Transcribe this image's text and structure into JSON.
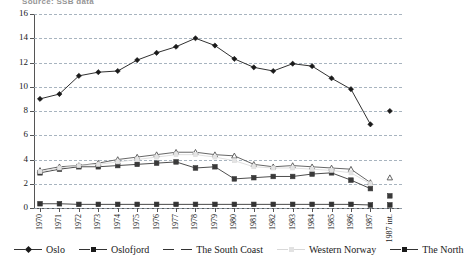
{
  "source_note": "Source: SSB data",
  "chart_data": {
    "type": "line",
    "title": "",
    "xlabel": "",
    "ylabel": "",
    "ylim": [
      0,
      16
    ],
    "yticks": [
      0,
      2,
      4,
      6,
      8,
      10,
      12,
      14,
      16
    ],
    "grid": true,
    "legend_position": "bottom",
    "categories": [
      "1970",
      "1971",
      "1972",
      "1973",
      "1974",
      "1975",
      "1976",
      "1977",
      "1978",
      "1979",
      "1980",
      "1981",
      "1982",
      "1983",
      "1984",
      "1985",
      "1986",
      "1987",
      "1987 int."
    ],
    "series": [
      {
        "name": "Oslo",
        "marker": "filled-diamond",
        "color": "#1a1a1a",
        "values": [
          9.0,
          9.4,
          10.9,
          11.2,
          11.3,
          12.2,
          12.8,
          13.3,
          14.0,
          13.4,
          12.3,
          11.6,
          11.3,
          11.9,
          11.7,
          10.7,
          9.8,
          6.9,
          5.2
        ]
      },
      {
        "name": "Oslofjord",
        "marker": "filled-square",
        "color": "#3a3a3a",
        "values": [
          2.9,
          3.2,
          3.4,
          3.4,
          3.5,
          3.6,
          3.7,
          3.8,
          3.3,
          3.4,
          2.4,
          2.5,
          2.6,
          2.6,
          2.8,
          2.9,
          2.3,
          1.6,
          1.0
        ]
      },
      {
        "name": "The South Coast",
        "marker": "open-triangle",
        "color": "#555555",
        "values": [
          3.1,
          3.4,
          3.5,
          3.7,
          4.0,
          4.2,
          4.4,
          4.6,
          4.6,
          4.4,
          4.3,
          3.6,
          3.4,
          3.5,
          3.4,
          3.3,
          3.2,
          2.1,
          1.2
        ]
      },
      {
        "name": "Western Norway",
        "marker": "faint",
        "color": "#d8d8d8",
        "values": [
          3.0,
          3.3,
          3.5,
          3.6,
          3.8,
          4.0,
          4.2,
          4.4,
          4.4,
          4.2,
          3.9,
          3.4,
          3.3,
          3.3,
          3.2,
          3.1,
          2.9,
          2.0,
          1.1
        ]
      },
      {
        "name": "The North",
        "marker": "filled-square",
        "color": "#333333",
        "values": [
          0.35,
          0.35,
          0.3,
          0.3,
          0.3,
          0.3,
          0.3,
          0.3,
          0.3,
          0.3,
          0.3,
          0.3,
          0.3,
          0.3,
          0.3,
          0.3,
          0.3,
          0.25,
          0.25
        ]
      }
    ],
    "detached_last_column": {
      "label": "1987 int.",
      "points": [
        {
          "series": "Oslo",
          "value": 8.0,
          "marker": "filled-diamond"
        },
        {
          "series": "The South Coast",
          "value": 2.5,
          "marker": "open-triangle"
        },
        {
          "series": "Oslofjord",
          "value": 1.0,
          "marker": "filled-square"
        },
        {
          "series": "The North",
          "value": 0.25,
          "marker": "filled-square"
        }
      ]
    }
  },
  "legend": {
    "items": [
      {
        "label": "Oslo",
        "marker": "diamond"
      },
      {
        "label": "Oslofjord",
        "marker": "square"
      },
      {
        "label": "The South Coast",
        "marker": "tri"
      },
      {
        "label": "Western Norway",
        "marker": "faintm"
      },
      {
        "label": "The North",
        "marker": "square"
      }
    ]
  }
}
